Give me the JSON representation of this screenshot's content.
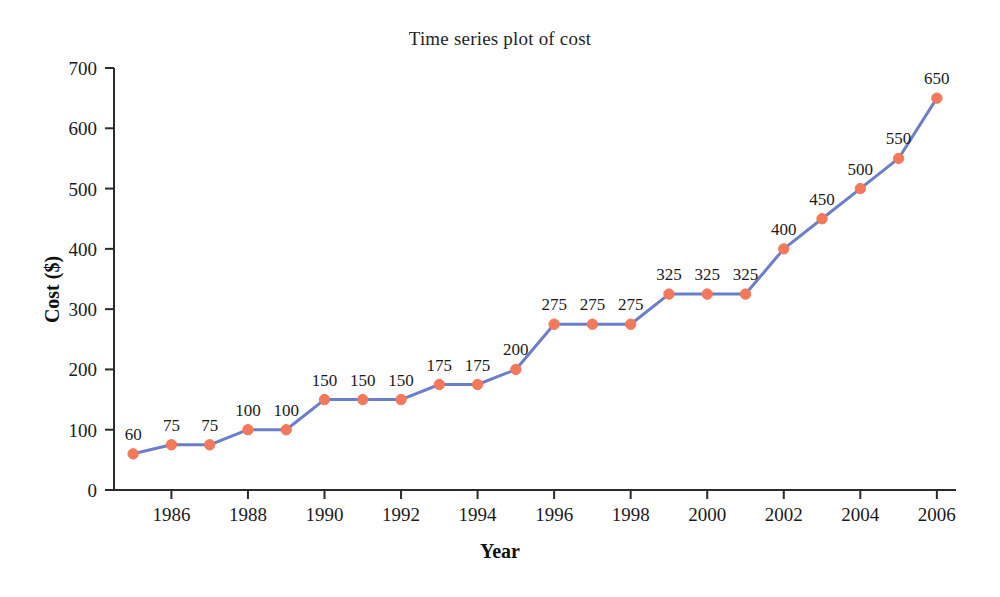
{
  "chart_data": {
    "type": "line",
    "title": "Time series plot of cost",
    "xlabel": "Year",
    "ylabel": "Cost ($)",
    "x": [
      1985,
      1986,
      1987,
      1988,
      1989,
      1990,
      1991,
      1992,
      1993,
      1994,
      1995,
      1996,
      1997,
      1998,
      1999,
      2000,
      2001,
      2002,
      2003,
      2004,
      2005,
      2006
    ],
    "values": [
      60,
      75,
      75,
      100,
      100,
      150,
      150,
      150,
      175,
      175,
      200,
      275,
      275,
      275,
      325,
      325,
      325,
      400,
      450,
      500,
      550,
      650
    ],
    "point_labels": [
      "60",
      "75",
      "75",
      "100",
      "100",
      "150",
      "150",
      "150",
      "175",
      "175",
      "200",
      "275",
      "275",
      "275",
      "325",
      "325",
      "325",
      "400",
      "450",
      "500",
      "550",
      "650"
    ],
    "xlim": [
      1984.5,
      2006.5
    ],
    "ylim": [
      0,
      700
    ],
    "ytick_values": [
      0,
      100,
      200,
      300,
      400,
      500,
      600,
      700
    ],
    "ytick_labels": [
      "0",
      "100",
      "200",
      "300",
      "400",
      "500",
      "600",
      "700"
    ],
    "xtick_values": [
      1986,
      1988,
      1990,
      1992,
      1994,
      1996,
      1998,
      2000,
      2002,
      2004,
      2006
    ],
    "xtick_labels": [
      "1986",
      "1988",
      "1990",
      "1992",
      "1994",
      "1996",
      "1998",
      "2000",
      "2002",
      "2004",
      "2006"
    ],
    "grid": false,
    "legend": "none",
    "line_color": "#6b7fc8",
    "marker_color": "#f4785a",
    "axis_color": "#2b2b2b",
    "background_color": "#ffffff"
  }
}
